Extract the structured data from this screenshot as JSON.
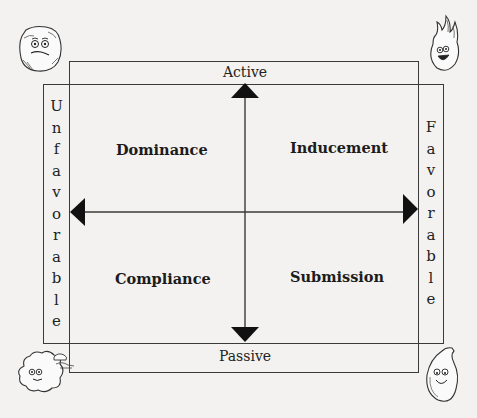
{
  "diagram": {
    "poles": {
      "top": "Active",
      "bottom": "Passive",
      "left": "Unfavorable",
      "right": "Favorable"
    },
    "left_letters": [
      "U",
      "n",
      "f",
      "a",
      "v",
      "o",
      "r",
      "a",
      "b",
      "l",
      "e"
    ],
    "right_letters": [
      "F",
      "a",
      "v",
      "o",
      "r",
      "a",
      "b",
      "l",
      "e"
    ],
    "quadrants": {
      "top_left": "Dominance",
      "top_right": "Inducement",
      "bottom_left": "Compliance",
      "bottom_right": "Submission"
    },
    "corner_characters": {
      "top_left": "earth-rock-face",
      "top_right": "fire-flame-face",
      "bottom_left": "air-cloud-face",
      "bottom_right": "water-drop-face"
    },
    "colors": {
      "line": "#3a3a3a",
      "arrow": "#111111",
      "background": "#f3f2f0"
    }
  }
}
